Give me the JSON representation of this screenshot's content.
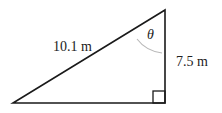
{
  "diagram": {
    "type": "right-triangle",
    "hypotenuse_label": "10.1 m",
    "vertical_side_label": "7.5 m",
    "angle_label": "θ",
    "right_angle_marker": true,
    "vertices": {
      "top": [
        165,
        10
      ],
      "bottom_right": [
        165,
        103
      ],
      "bottom_left": [
        13,
        103
      ]
    },
    "colors": {
      "line": "#1a1a1a",
      "arc": "#b8b8b8",
      "text": "#222222"
    }
  }
}
